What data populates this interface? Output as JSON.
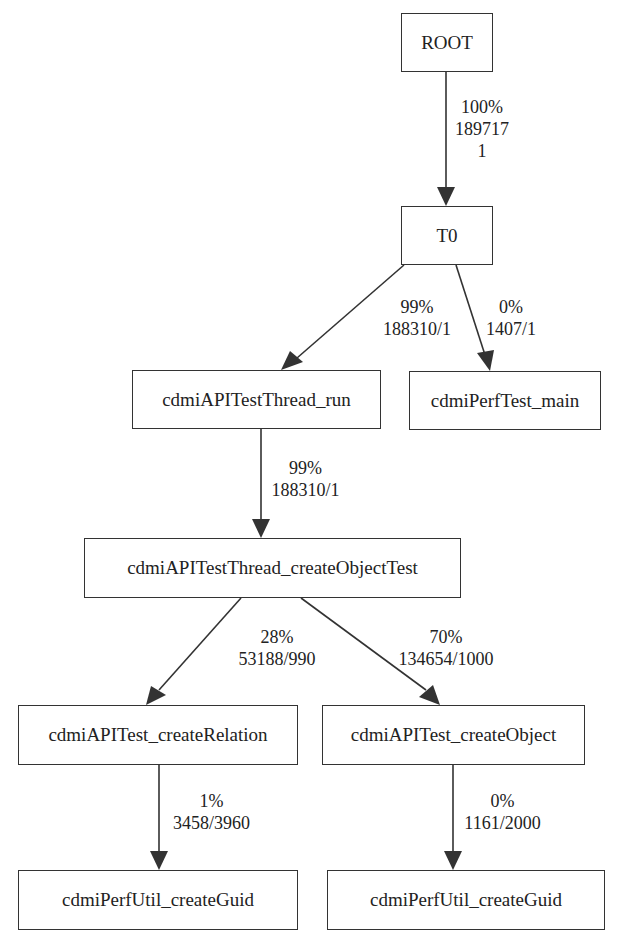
{
  "graph": {
    "type": "call-graph",
    "nodes": [
      {
        "id": "root",
        "label": "ROOT"
      },
      {
        "id": "t0",
        "label": "T0"
      },
      {
        "id": "thread_run",
        "label": "cdmiAPITestThread_run"
      },
      {
        "id": "perf_main",
        "label": "cdmiPerfTest_main"
      },
      {
        "id": "create_object_test",
        "label": "cdmiAPITestThread_createObjectTest"
      },
      {
        "id": "create_relation",
        "label": "cdmiAPITest_createRelation"
      },
      {
        "id": "create_object",
        "label": "cdmiAPITest_createObject"
      },
      {
        "id": "create_guid_1",
        "label": "cdmiPerfUtil_createGuid"
      },
      {
        "id": "create_guid_2",
        "label": "cdmiPerfUtil_createGuid"
      }
    ],
    "edges": [
      {
        "from": "root",
        "to": "t0",
        "percent": "100%",
        "line2": "189717",
        "line3": "1"
      },
      {
        "from": "t0",
        "to": "thread_run",
        "percent": "99%",
        "line2": "188310/1"
      },
      {
        "from": "t0",
        "to": "perf_main",
        "percent": "0%",
        "line2": "1407/1"
      },
      {
        "from": "thread_run",
        "to": "create_object_test",
        "percent": "99%",
        "line2": "188310/1"
      },
      {
        "from": "create_object_test",
        "to": "create_relation",
        "percent": "28%",
        "line2": "53188/990"
      },
      {
        "from": "create_object_test",
        "to": "create_object",
        "percent": "70%",
        "line2": "134654/1000"
      },
      {
        "from": "create_relation",
        "to": "create_guid_1",
        "percent": "1%",
        "line2": "3458/3960"
      },
      {
        "from": "create_object",
        "to": "create_guid_2",
        "percent": "0%",
        "line2": "1161/2000"
      }
    ]
  },
  "colors": {
    "line": "#333333",
    "text": "#222222",
    "background": "#ffffff"
  }
}
